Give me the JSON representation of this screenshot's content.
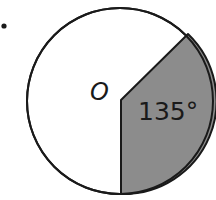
{
  "diagram": {
    "bullet": "•",
    "center_label": "O",
    "angle_label": "135°",
    "colors": {
      "sector_fill": "#8c8c8c",
      "stroke": "#1a1a1a",
      "background": "#ffffff"
    },
    "circle": {
      "cx": 120,
      "cy": 101,
      "r": 93
    },
    "sector_angle_deg": 135
  }
}
